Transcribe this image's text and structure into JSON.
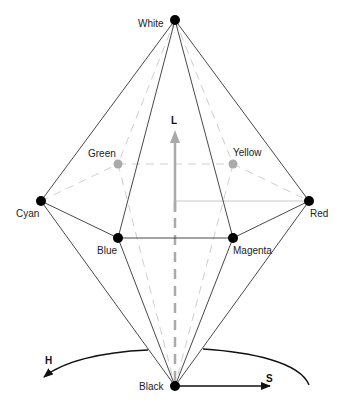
{
  "diagram": {
    "vertices": {
      "white": {
        "label": "White",
        "x": 175,
        "y": 20,
        "hidden": false
      },
      "green": {
        "label": "Green",
        "x": 118,
        "y": 164,
        "hidden": true
      },
      "yellow": {
        "label": "Yellow",
        "x": 233,
        "y": 164,
        "hidden": true
      },
      "cyan": {
        "label": "Cyan",
        "x": 41,
        "y": 201,
        "hidden": false
      },
      "red": {
        "label": "Red",
        "x": 309,
        "y": 201,
        "hidden": false
      },
      "blue": {
        "label": "Blue",
        "x": 118,
        "y": 238,
        "hidden": false
      },
      "magenta": {
        "label": "Magenta",
        "x": 233,
        "y": 238,
        "hidden": false
      },
      "black": {
        "label": "Black",
        "x": 175,
        "y": 386,
        "hidden": false
      }
    },
    "axes": {
      "lightness": {
        "label": "L"
      },
      "hue": {
        "label": "H"
      },
      "saturation": {
        "label": "S"
      }
    },
    "colors": {
      "edge": "#333333",
      "hidden_edge": "#c8c8c8",
      "hidden_point": "#aaaaaa",
      "axis_arrow": "#aaaaaa",
      "point": "#000000"
    }
  }
}
